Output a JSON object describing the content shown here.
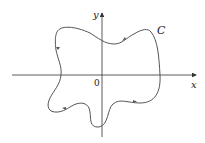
{
  "diagram": {
    "axis_x_label": "x",
    "axis_y_label": "y",
    "origin_label": "0",
    "curve_label": "C",
    "orientation": "counterclockwise",
    "colors": {
      "axis": "#333333",
      "curve": "#555555",
      "arrow": "#555555",
      "background": "#ffffff"
    }
  }
}
